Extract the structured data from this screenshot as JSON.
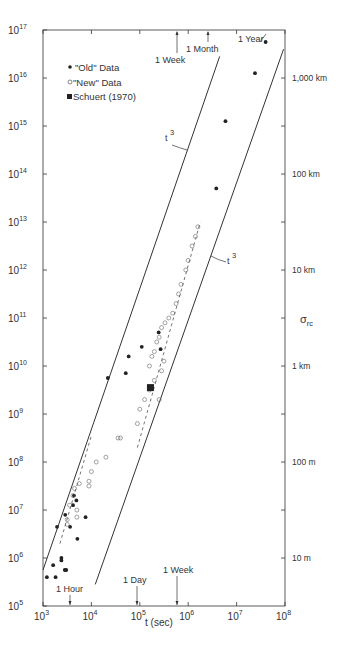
{
  "chart_data": {
    "type": "scatter",
    "title": "",
    "xlabel": "t (sec)",
    "ylabel": "",
    "right_axis_label": "σ_rc",
    "x_scale": "log",
    "y_scale": "log",
    "xlim": [
      1000,
      100000000
    ],
    "ylim": [
      100000,
      100000000000000000
    ],
    "grid": false,
    "x_ticks": [
      "10^3",
      "10^4",
      "10^5",
      "10^6",
      "10^7",
      "10^8"
    ],
    "y_ticks": [
      "10^5",
      "10^6",
      "10^7",
      "10^8",
      "10^9",
      "10^10",
      "10^11",
      "10^12",
      "10^13",
      "10^14",
      "10^15",
      "10^16",
      "10^17"
    ],
    "right_ticks": [
      {
        "label": "1,000 km",
        "y_log": 16
      },
      {
        "label": "100 km",
        "y_log": 14
      },
      {
        "label": "10 km",
        "y_log": 12
      },
      {
        "label": "1 km",
        "y_log": 10
      },
      {
        "label": "100 m",
        "y_log": 8
      },
      {
        "label": "10 m",
        "y_log": 6
      }
    ],
    "legend": {
      "position": "upper-left",
      "entries": [
        {
          "marker": "filled-circle",
          "label": "\"Old\" Data"
        },
        {
          "marker": "open-circle",
          "label": "\"New\" Data"
        },
        {
          "marker": "filled-square",
          "label": "Schuert (1970)"
        }
      ]
    },
    "annotations": {
      "top": [
        {
          "label": "1 Week",
          "x_log": 5.78
        },
        {
          "label": "1 Month",
          "x_log": 6.41
        },
        {
          "label": "1 Year",
          "x_log": 7.5
        }
      ],
      "bottom": [
        {
          "label": "1 Hour",
          "x_log": 3.56
        },
        {
          "label": "1 Day",
          "x_log": 4.94
        },
        {
          "label": "1 Week",
          "x_log": 5.78
        }
      ],
      "line_labels": [
        {
          "label": "t³",
          "note": "left bounding line"
        },
        {
          "label": "t³",
          "note": "right bounding line"
        }
      ]
    },
    "series": [
      {
        "name": "\"Old\" Data",
        "marker": "filled-circle",
        "points_log": [
          [
            7.6,
            16.75
          ],
          [
            7.38,
            16.1
          ],
          [
            6.77,
            15.1
          ],
          [
            6.58,
            13.7
          ],
          [
            5.39,
            10.7
          ],
          [
            5.43,
            10.35
          ],
          [
            5.04,
            10.4
          ],
          [
            4.77,
            10.2
          ],
          [
            4.71,
            9.85
          ],
          [
            4.34,
            9.75
          ],
          [
            3.64,
            7.3
          ],
          [
            3.69,
            7.2
          ],
          [
            3.62,
            7.1
          ],
          [
            3.46,
            6.9
          ],
          [
            3.88,
            6.85
          ],
          [
            3.56,
            6.65
          ],
          [
            3.29,
            6.65
          ],
          [
            3.71,
            6.4
          ],
          [
            3.38,
            6.0
          ],
          [
            3.38,
            5.95
          ],
          [
            3.21,
            5.85
          ],
          [
            3.45,
            5.75
          ],
          [
            3.48,
            5.75
          ],
          [
            3.08,
            5.6
          ],
          [
            3.26,
            5.6
          ]
        ]
      },
      {
        "name": "\"New\" Data",
        "marker": "open-circle",
        "points_log": [
          [
            6.2,
            12.9
          ],
          [
            6.15,
            12.7
          ],
          [
            6.08,
            12.5
          ],
          [
            6.0,
            12.2
          ],
          [
            5.95,
            12.0
          ],
          [
            5.85,
            11.7
          ],
          [
            5.8,
            11.5
          ],
          [
            5.75,
            11.3
          ],
          [
            5.68,
            11.1
          ],
          [
            5.6,
            11.0
          ],
          [
            5.52,
            10.9
          ],
          [
            5.45,
            10.8
          ],
          [
            5.4,
            10.6
          ],
          [
            5.35,
            10.5
          ],
          [
            5.3,
            10.3
          ],
          [
            5.25,
            10.2
          ],
          [
            5.2,
            10.0
          ],
          [
            5.5,
            10.1
          ],
          [
            5.45,
            9.9
          ],
          [
            5.3,
            9.7
          ],
          [
            5.2,
            9.5
          ],
          [
            5.1,
            9.3
          ],
          [
            5.4,
            9.3
          ],
          [
            5.0,
            9.1
          ],
          [
            4.95,
            8.8
          ],
          [
            4.55,
            8.5
          ],
          [
            4.6,
            8.5
          ],
          [
            4.3,
            8.1
          ],
          [
            4.1,
            8.0
          ],
          [
            4.0,
            7.8
          ],
          [
            3.95,
            7.6
          ],
          [
            3.95,
            7.5
          ],
          [
            3.75,
            7.55
          ],
          [
            3.65,
            7.45
          ],
          [
            3.62,
            7.3
          ],
          [
            3.55,
            7.1
          ],
          [
            3.7,
            7.0
          ],
          [
            3.7,
            6.85
          ],
          [
            3.5,
            6.8
          ],
          [
            3.5,
            6.7
          ]
        ]
      },
      {
        "name": "Schuert (1970)",
        "marker": "filled-square",
        "points_log": [
          [
            5.22,
            9.55
          ]
        ]
      }
    ],
    "reference_lines": [
      {
        "name": "t³ (left)",
        "style": "solid",
        "from_log": [
          3.0,
          5.75
        ],
        "to_log": [
          6.65,
          16.45
        ]
      },
      {
        "name": "t³ (right)",
        "style": "solid",
        "from_log": [
          4.08,
          5.45
        ],
        "to_log": [
          7.97,
          16.6
        ]
      },
      {
        "name": "fit old",
        "style": "dashed",
        "from_log": [
          3.35,
          6.3
        ],
        "to_log": [
          4.0,
          8.55
        ]
      },
      {
        "name": "fit new",
        "style": "dashed",
        "from_log": [
          4.95,
          8.3
        ],
        "to_log": [
          6.25,
          13.0
        ]
      }
    ]
  },
  "labels": {
    "x_axis_title": "t (sec)",
    "right_axis_title": "σ",
    "right_axis_sub": "rc",
    "legend_old": "\"Old\" Data",
    "legend_new": "\"New\" Data",
    "legend_schuert": "Schuert (1970)",
    "t3_left": "t",
    "t3_right": "t",
    "t3_exp": "3"
  }
}
